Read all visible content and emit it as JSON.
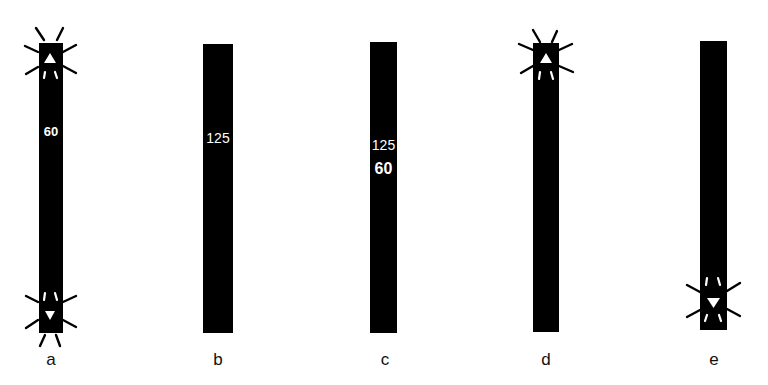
{
  "figure": {
    "background": "#ffffff",
    "bar_color": "#000000",
    "panels": [
      {
        "id": "a",
        "label": "a",
        "numbers": [
          "60"
        ],
        "indicators": [
          {
            "type": "triangle-up",
            "position": "top",
            "blinking": true
          },
          {
            "type": "triangle-down",
            "position": "bottom",
            "blinking": true
          }
        ]
      },
      {
        "id": "b",
        "label": "b",
        "numbers": [
          "125"
        ],
        "indicators": []
      },
      {
        "id": "c",
        "label": "c",
        "numbers": [
          "125",
          "60"
        ],
        "indicators": []
      },
      {
        "id": "d",
        "label": "d",
        "numbers": [],
        "indicators": [
          {
            "type": "triangle-up",
            "position": "top",
            "blinking": true
          }
        ]
      },
      {
        "id": "e",
        "label": "e",
        "numbers": [],
        "indicators": [
          {
            "type": "triangle-down",
            "position": "near-bottom",
            "blinking": true
          }
        ]
      }
    ]
  }
}
